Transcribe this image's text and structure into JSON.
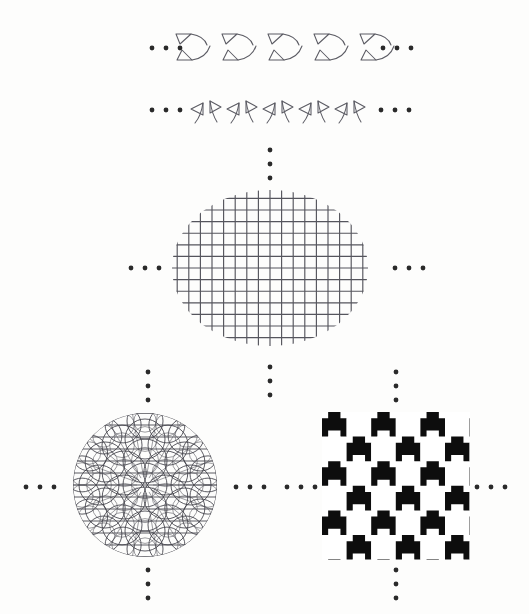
{
  "figure": {
    "background_color": "#fdfdfc",
    "ink_color": "#4a4a52",
    "dot_color": "#2a2a2a",
    "black_fill": "#0d0d0d",
    "white_fill": "#ffffff",
    "width": 529,
    "height": 614
  },
  "panels": [
    {
      "id": "frieze-row-1",
      "name": "frieze-pattern-triangle-arc",
      "kind": "frieze",
      "description": "Row of repeated motifs: small open triangle with trailing arc, stacked in two offset rows",
      "repeat_count": 5,
      "motif_name": "triangle-arc-motif",
      "center_y": 48,
      "start_x": 176,
      "step_x": 46,
      "leading_ellipsis": "...",
      "trailing_ellipsis": "..."
    },
    {
      "id": "frieze-row-2",
      "name": "frieze-pattern-mirrored-pairs",
      "kind": "frieze",
      "description": "Row of mirrored triangle-hook pairs repeated horizontally",
      "repeat_count": 5,
      "motif_name": "mirrored-pair-motif",
      "center_y": 110,
      "start_x": 192,
      "step_x": 36,
      "leading_ellipsis": "...",
      "trailing_ellipsis": "..."
    },
    {
      "id": "lattice-ellipse",
      "name": "square-lattice-in-ellipse",
      "kind": "lattice",
      "description": "Square grid of horizontal and vertical lines clipped to an ellipse",
      "center_x": 270,
      "center_y": 268,
      "radius_x": 98,
      "radius_y": 78,
      "cell_size": 11.6,
      "grid_lines_horizontal": 14,
      "grid_lines_vertical": 18
    },
    {
      "id": "hyperbolic-disk",
      "name": "circular-arc-tiling-disk",
      "kind": "arc-tiling",
      "description": "Disk filled with intersecting circular arcs and straight chords forming a dense ornamental tiling",
      "center_x": 145,
      "center_y": 485,
      "radius": 72,
      "ring_counts": [
        6,
        12,
        18
      ],
      "arc_rings": 3
    },
    {
      "id": "fractal-tessellation",
      "name": "interlocking-tile-tessellation",
      "kind": "tessellation",
      "description": "Square block filled with black and white interlocking T / cross shaped tiles in checkerboard arrangement",
      "left": 322,
      "top": 412,
      "width": 148,
      "height": 148,
      "tile_size": 24.6,
      "tiles_across": 6,
      "tiles_down": 6,
      "colors": [
        "#0d0d0d",
        "#ffffff"
      ]
    }
  ],
  "ellipsis_groups": [
    {
      "id": "ell-row1-left",
      "name": "ellipsis-row1-left",
      "orientation": "horizontal",
      "count": 3,
      "x": 152,
      "y": 48,
      "spacing": 14
    },
    {
      "id": "ell-row1-right",
      "name": "ellipsis-row1-right",
      "orientation": "horizontal",
      "count": 3,
      "x": 383,
      "y": 48,
      "spacing": 14
    },
    {
      "id": "ell-row2-left",
      "name": "ellipsis-row2-left",
      "orientation": "horizontal",
      "count": 3,
      "x": 152,
      "y": 110,
      "spacing": 14
    },
    {
      "id": "ell-row2-right",
      "name": "ellipsis-row2-right",
      "orientation": "horizontal",
      "count": 3,
      "x": 381,
      "y": 110,
      "spacing": 14
    },
    {
      "id": "ell-lattice-top",
      "name": "ellipsis-lattice-top",
      "orientation": "vertical",
      "count": 3,
      "x": 270,
      "y": 150,
      "spacing": 14
    },
    {
      "id": "ell-lattice-left",
      "name": "ellipsis-lattice-left",
      "orientation": "horizontal",
      "count": 3,
      "x": 131,
      "y": 268,
      "spacing": 14
    },
    {
      "id": "ell-lattice-right",
      "name": "ellipsis-lattice-right",
      "orientation": "horizontal",
      "count": 3,
      "x": 395,
      "y": 268,
      "spacing": 14
    },
    {
      "id": "ell-lattice-bottom",
      "name": "ellipsis-lattice-bottom",
      "orientation": "vertical",
      "count": 3,
      "x": 270,
      "y": 367,
      "spacing": 14
    },
    {
      "id": "ell-disk-top",
      "name": "ellipsis-disk-top",
      "orientation": "vertical",
      "count": 3,
      "x": 148,
      "y": 372,
      "spacing": 14
    },
    {
      "id": "ell-disk-left",
      "name": "ellipsis-disk-left",
      "orientation": "horizontal",
      "count": 3,
      "x": 26,
      "y": 487,
      "spacing": 14
    },
    {
      "id": "ell-disk-right",
      "name": "ellipsis-disk-right",
      "orientation": "horizontal",
      "count": 3,
      "x": 236,
      "y": 487,
      "spacing": 14
    },
    {
      "id": "ell-disk-bottom",
      "name": "ellipsis-disk-bottom",
      "orientation": "vertical",
      "count": 3,
      "x": 148,
      "y": 570,
      "spacing": 14
    },
    {
      "id": "ell-tess-top",
      "name": "ellipsis-tessellation-top",
      "orientation": "vertical",
      "count": 3,
      "x": 396,
      "y": 372,
      "spacing": 14
    },
    {
      "id": "ell-tess-left",
      "name": "ellipsis-tessellation-left",
      "orientation": "horizontal",
      "count": 3,
      "x": 287,
      "y": 487,
      "spacing": 14
    },
    {
      "id": "ell-tess-right",
      "name": "ellipsis-tessellation-right",
      "orientation": "horizontal",
      "count": 3,
      "x": 477,
      "y": 487,
      "spacing": 14
    },
    {
      "id": "ell-tess-bottom",
      "name": "ellipsis-tessellation-bottom",
      "orientation": "vertical",
      "count": 3,
      "x": 396,
      "y": 570,
      "spacing": 14
    }
  ]
}
